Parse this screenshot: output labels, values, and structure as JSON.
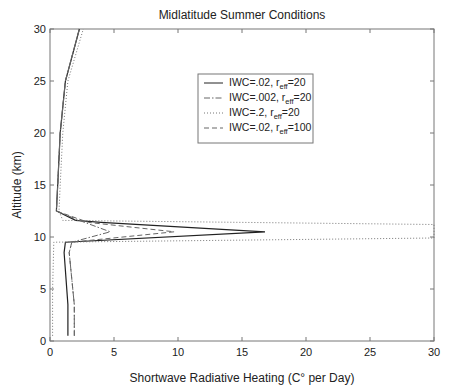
{
  "chart_data": {
    "type": "line",
    "title": "Midlatitude Summer Conditions",
    "xlabel": "Shortwave Radiative Heating (C° per Day)",
    "ylabel": "Altitude (km)",
    "xlim": [
      0,
      30
    ],
    "ylim": [
      0,
      30
    ],
    "xticks": [
      0,
      5,
      10,
      15,
      20,
      25,
      30
    ],
    "yticks": [
      0,
      5,
      10,
      15,
      20,
      25,
      30
    ],
    "grid": false,
    "legend_position": "upper-center-right",
    "series": [
      {
        "name": "IWC=.02, r_eff=20",
        "label_main": "IWC=.02, r",
        "label_sub": "eff",
        "label_tail": "=20",
        "style": "solid",
        "points": [
          [
            1.4,
            0.5
          ],
          [
            1.4,
            3.5
          ],
          [
            1.1,
            8.5
          ],
          [
            1.2,
            9.5
          ],
          [
            16.8,
            10.5
          ],
          [
            4.0,
            11.4
          ],
          [
            2.0,
            11.6
          ],
          [
            0.5,
            12.5
          ],
          [
            0.6,
            15
          ],
          [
            0.8,
            20
          ],
          [
            1.2,
            25
          ],
          [
            2.3,
            30
          ]
        ]
      },
      {
        "name": "IWC=.002, r_eff=20",
        "label_main": "IWC=.002, r",
        "label_sub": "eff",
        "label_tail": "=20",
        "style": "dashdot",
        "points": [
          [
            1.9,
            0.5
          ],
          [
            1.9,
            3.5
          ],
          [
            1.5,
            8.5
          ],
          [
            1.7,
            9.5
          ],
          [
            4.7,
            10.5
          ],
          [
            2.5,
            11.5
          ],
          [
            0.5,
            12.5
          ],
          [
            0.6,
            15
          ],
          [
            0.8,
            20
          ],
          [
            1.2,
            25
          ],
          [
            2.3,
            30
          ]
        ]
      },
      {
        "name": "IWC=.2, r_eff=20",
        "label_main": "IWC=.2, r",
        "label_sub": "eff",
        "label_tail": "=20",
        "style": "dotted",
        "points": [
          [
            0.2,
            0.5
          ],
          [
            0.2,
            5
          ],
          [
            0.3,
            9.5
          ],
          [
            30,
            9.9
          ],
          [
            30,
            11.2
          ],
          [
            1.0,
            11.6
          ],
          [
            0.7,
            12.5
          ],
          [
            0.8,
            15
          ],
          [
            1.0,
            20
          ],
          [
            1.4,
            25
          ],
          [
            2.6,
            30
          ]
        ]
      },
      {
        "name": "IWC=.02, r_eff=100",
        "label_main": "IWC=.02, r",
        "label_sub": "eff",
        "label_tail": "=100",
        "style": "dashed",
        "points": [
          [
            1.9,
            0.5
          ],
          [
            1.9,
            3.5
          ],
          [
            1.5,
            8.5
          ],
          [
            1.7,
            9.5
          ],
          [
            9.7,
            10.5
          ],
          [
            3.0,
            11.4
          ],
          [
            0.5,
            12.5
          ],
          [
            0.6,
            15
          ],
          [
            0.8,
            20
          ],
          [
            1.2,
            25
          ],
          [
            2.3,
            30
          ]
        ]
      }
    ]
  }
}
